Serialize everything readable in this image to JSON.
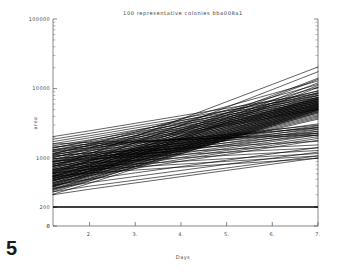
{
  "figure": {
    "number_label": "5",
    "background_color": "#ffffff",
    "line_color": "#000000",
    "text_color": "#444444"
  },
  "chart_data": {
    "type": "line",
    "title": "100 representative colonies  bba008a1",
    "xlabel": "Days",
    "ylabel": "area",
    "xlim": [
      1.2,
      7.0
    ],
    "ylim": [
      0,
      100000
    ],
    "yscale": "log",
    "xscale": "linear",
    "grid": false,
    "legend": false,
    "x_ticks": [
      "2.",
      "3.",
      "4.",
      "5.",
      "6.",
      "7."
    ],
    "x_tick_values": [
      2,
      3,
      4,
      5,
      6,
      7
    ],
    "y_ticks": [
      "100000",
      "10000",
      "1000",
      "200",
      "0"
    ],
    "y_tick_values": [
      100000,
      10000,
      1000,
      200,
      0
    ],
    "n_series": 100,
    "series_description": "100 colony area growth trajectories, log-scale, mostly rising from ~300-2000 at day 1.2 to ~1500-20000 at day 7, plus one flat baseline series at area 200",
    "baseline_series": {
      "name": "baseline",
      "value": 200,
      "x": [
        1.2,
        7.0
      ],
      "y": [
        200,
        200
      ]
    },
    "x": [
      1.2,
      2.0,
      3.0,
      4.0,
      5.0,
      6.0,
      7.0
    ],
    "series": [
      {
        "name": "c1",
        "values": [
          760,
          1150,
          2050,
          3650,
          6500,
          11500,
          20500
        ]
      },
      {
        "name": "c2",
        "values": [
          620,
          930,
          1680,
          3000,
          5400,
          9700,
          17500
        ]
      },
      {
        "name": "c3",
        "values": [
          540,
          800,
          1420,
          2520,
          4480,
          7950,
          14100
        ]
      },
      {
        "name": "c4",
        "values": [
          480,
          720,
          1300,
          2340,
          4200,
          7550,
          13600
        ]
      },
      {
        "name": "c5",
        "values": [
          440,
          660,
          1180,
          2110,
          3780,
          6760,
          12100
        ]
      },
      {
        "name": "c6",
        "values": [
          410,
          610,
          1090,
          1950,
          3480,
          6220,
          11100
        ]
      },
      {
        "name": "c7",
        "values": [
          390,
          580,
          1030,
          1840,
          3280,
          5850,
          10400
        ]
      },
      {
        "name": "c8",
        "values": [
          1150,
          1560,
          2380,
          3630,
          5540,
          8450,
          12900
        ]
      },
      {
        "name": "c9",
        "values": [
          1020,
          1390,
          2120,
          3240,
          4940,
          7540,
          11500
        ]
      },
      {
        "name": "c10",
        "values": [
          930,
          1270,
          1940,
          2960,
          4510,
          6880,
          10500
        ]
      },
      {
        "name": "c11",
        "values": [
          880,
          1180,
          1790,
          2700,
          4090,
          6190,
          9370
        ]
      },
      {
        "name": "c12",
        "values": [
          820,
          1100,
          1670,
          2530,
          3830,
          5800,
          8790
        ]
      },
      {
        "name": "c13",
        "values": [
          770,
          1040,
          1580,
          2400,
          3640,
          5530,
          8390
        ]
      },
      {
        "name": "c14",
        "values": [
          720,
          970,
          1480,
          2250,
          3420,
          5210,
          7930
        ]
      },
      {
        "name": "c15",
        "values": [
          680,
          920,
          1400,
          2130,
          3240,
          4930,
          7500
        ]
      },
      {
        "name": "c16",
        "values": [
          640,
          870,
          1330,
          2030,
          3100,
          4730,
          7220
        ]
      },
      {
        "name": "c17",
        "values": [
          600,
          820,
          1260,
          1930,
          2960,
          4540,
          6960
        ]
      },
      {
        "name": "c18",
        "values": [
          570,
          780,
          1200,
          1840,
          2830,
          4350,
          6680
        ]
      },
      {
        "name": "c19",
        "values": [
          540,
          740,
          1140,
          1760,
          2710,
          4180,
          6440
        ]
      },
      {
        "name": "c20",
        "values": [
          510,
          700,
          1080,
          1670,
          2580,
          3980,
          6150
        ]
      },
      {
        "name": "c21",
        "values": [
          490,
          670,
          1040,
          1610,
          2490,
          3860,
          5980
        ]
      },
      {
        "name": "c22",
        "values": [
          470,
          645,
          1000,
          1550,
          2400,
          3720,
          5770
        ]
      },
      {
        "name": "c23",
        "values": [
          450,
          620,
          960,
          1490,
          2310,
          3590,
          5570
        ]
      },
      {
        "name": "c24",
        "values": [
          430,
          595,
          925,
          1440,
          2240,
          3480,
          5420
        ]
      },
      {
        "name": "c25",
        "values": [
          415,
          575,
          895,
          1395,
          2170,
          3380,
          5270
        ]
      },
      {
        "name": "c26",
        "values": [
          400,
          555,
          865,
          1350,
          2100,
          3280,
          5120
        ]
      },
      {
        "name": "c27",
        "values": [
          385,
          535,
          835,
          1305,
          2040,
          3190,
          4990
        ]
      },
      {
        "name": "c28",
        "values": [
          370,
          515,
          805,
          1260,
          1970,
          3090,
          4840
        ]
      },
      {
        "name": "c29",
        "values": [
          355,
          495,
          775,
          1215,
          1900,
          2990,
          4690
        ]
      },
      {
        "name": "c30",
        "values": [
          345,
          480,
          750,
          1175,
          1840,
          2890,
          4540
        ]
      },
      {
        "name": "c31",
        "values": [
          1400,
          1790,
          2480,
          3440,
          4780,
          6630,
          9200
        ]
      },
      {
        "name": "c32",
        "values": [
          1280,
          1640,
          2280,
          3170,
          4410,
          6140,
          8540
        ]
      },
      {
        "name": "c33",
        "values": [
          1180,
          1520,
          2120,
          2950,
          4110,
          5730,
          7990
        ]
      },
      {
        "name": "c34",
        "values": [
          1100,
          1420,
          1980,
          2760,
          3850,
          5370,
          7490
        ]
      },
      {
        "name": "c35",
        "values": [
          1030,
          1330,
          1860,
          2600,
          3630,
          5070,
          7080
        ]
      },
      {
        "name": "c36",
        "values": [
          970,
          1255,
          1760,
          2460,
          3440,
          4810,
          6720
        ]
      },
      {
        "name": "c37",
        "values": [
          910,
          1180,
          1660,
          2320,
          3250,
          4550,
          6370
        ]
      },
      {
        "name": "c38",
        "values": [
          860,
          1115,
          1570,
          2200,
          3080,
          4320,
          6050
        ]
      },
      {
        "name": "c39",
        "values": [
          810,
          1055,
          1485,
          2085,
          2925,
          4105,
          5760
        ]
      },
      {
        "name": "c40",
        "values": [
          770,
          1000,
          1410,
          1980,
          2780,
          3900,
          5480
        ]
      },
      {
        "name": "c41",
        "values": [
          730,
          950,
          1340,
          1885,
          2650,
          3720,
          5230
        ]
      },
      {
        "name": "c42",
        "values": [
          695,
          905,
          1280,
          1800,
          2535,
          3565,
          5020
        ]
      },
      {
        "name": "c43",
        "values": [
          660,
          860,
          1215,
          1715,
          2420,
          3410,
          4810
        ]
      },
      {
        "name": "c44",
        "values": [
          630,
          820,
          1160,
          1640,
          2315,
          3265,
          4610
        ]
      },
      {
        "name": "c45",
        "values": [
          600,
          782,
          1108,
          1568,
          2215,
          3128,
          4420
        ]
      },
      {
        "name": "c46",
        "values": [
          575,
          750,
          1062,
          1504,
          2126,
          3005,
          4250
        ]
      },
      {
        "name": "c47",
        "values": [
          550,
          718,
          1018,
          1442,
          2040,
          2886,
          4085
        ]
      },
      {
        "name": "c48",
        "values": [
          528,
          690,
          978,
          1386,
          1963,
          2780,
          3938
        ]
      },
      {
        "name": "c49",
        "values": [
          506,
          661,
          938,
          1330,
          1885,
          2671,
          3786
        ]
      },
      {
        "name": "c50",
        "values": [
          486,
          635,
          902,
          1280,
          1815,
          2574,
          3650
        ]
      },
      {
        "name": "c51",
        "values": [
          2050,
          2480,
          3180,
          4080,
          5230,
          6700,
          8600
        ]
      },
      {
        "name": "c52",
        "values": [
          1880,
          2280,
          2930,
          3760,
          4830,
          6200,
          7960
        ]
      },
      {
        "name": "c53",
        "values": [
          1740,
          2110,
          2720,
          3500,
          4500,
          5790,
          7450
        ]
      },
      {
        "name": "c54",
        "values": [
          1620,
          1970,
          2540,
          3270,
          4210,
          5420,
          6980
        ]
      },
      {
        "name": "c55",
        "values": [
          1510,
          1840,
          2375,
          3065,
          3950,
          5095,
          6570
        ]
      },
      {
        "name": "c56",
        "values": [
          1420,
          1730,
          2235,
          2885,
          3725,
          4810,
          6210
        ]
      },
      {
        "name": "c57",
        "values": [
          1330,
          1622,
          2098,
          2712,
          3505,
          4532,
          5860
        ]
      },
      {
        "name": "c58",
        "values": [
          1255,
          1532,
          1983,
          2566,
          3320,
          4297,
          5562
        ]
      },
      {
        "name": "c59",
        "values": [
          1180,
          1442,
          1868,
          2420,
          3135,
          4062,
          5262
        ]
      },
      {
        "name": "c60",
        "values": [
          1115,
          1364,
          1768,
          2293,
          2973,
          3855,
          5000
        ]
      },
      {
        "name": "c61",
        "values": [
          305,
          438,
          712,
          1156,
          1878,
          3050,
          4955
        ]
      },
      {
        "name": "c62",
        "values": [
          330,
          470,
          760,
          1228,
          1985,
          3210,
          5190
        ]
      },
      {
        "name": "c63",
        "values": [
          360,
          510,
          818,
          1313,
          2106,
          3380,
          5425
        ]
      },
      {
        "name": "c64",
        "values": [
          395,
          556,
          885,
          1409,
          2243,
          3570,
          5682
        ]
      },
      {
        "name": "c65",
        "values": [
          430,
          602,
          952,
          1506,
          2382,
          3768,
          5960
        ]
      },
      {
        "name": "c66",
        "values": [
          470,
          654,
          1026,
          1610,
          2527,
          3966,
          6225
        ]
      },
      {
        "name": "c67",
        "values": [
          515,
          712,
          1108,
          1724,
          2683,
          4175,
          6496
        ]
      },
      {
        "name": "c68",
        "values": [
          560,
          769,
          1188,
          1836,
          2836,
          4381,
          6769
        ]
      },
      {
        "name": "c69",
        "values": [
          610,
          833,
          1277,
          1958,
          3002,
          4602,
          7055
        ]
      },
      {
        "name": "c70",
        "values": [
          665,
          903,
          1374,
          2090,
          3180,
          4838,
          7360
        ]
      },
      {
        "name": "c71",
        "values": [
          890,
          1095,
          1350,
          1665,
          2050,
          2530,
          3120
        ]
      },
      {
        "name": "c72",
        "values": [
          820,
          1012,
          1252,
          1548,
          1915,
          2368,
          2930
        ]
      },
      {
        "name": "c73",
        "values": [
          760,
          940,
          1166,
          1446,
          1794,
          2226,
          2762
        ]
      },
      {
        "name": "c74",
        "values": [
          700,
          870,
          1082,
          1346,
          1675,
          2084,
          2592
        ]
      },
      {
        "name": "c75",
        "values": [
          650,
          810,
          1010,
          1260,
          1572,
          1961,
          2446
        ]
      },
      {
        "name": "c76",
        "values": [
          600,
          750,
          938,
          1174,
          1469,
          1838,
          2300
        ]
      },
      {
        "name": "c77",
        "values": [
          560,
          702,
          880,
          1104,
          1385,
          1737,
          2179
        ]
      },
      {
        "name": "c78",
        "values": [
          520,
          653,
          820,
          1031,
          1296,
          1629,
          2048
        ]
      },
      {
        "name": "c79",
        "values": [
          485,
          610,
          768,
          967,
          1218,
          1534,
          1932
        ]
      },
      {
        "name": "c80",
        "values": [
          450,
          568,
          717,
          904,
          1141,
          1440,
          1817
        ]
      },
      {
        "name": "c81",
        "values": [
          1250,
          1410,
          1640,
          1905,
          2215,
          2575,
          2995
        ]
      },
      {
        "name": "c82",
        "values": [
          1150,
          1302,
          1518,
          1770,
          2064,
          2406,
          2805
        ]
      },
      {
        "name": "c83",
        "values": [
          1060,
          1203,
          1406,
          1643,
          1920,
          2244,
          2622
        ]
      },
      {
        "name": "c84",
        "values": [
          980,
          1114,
          1305,
          1528,
          1790,
          2096,
          2455
        ]
      },
      {
        "name": "c85",
        "values": [
          905,
          1031,
          1210,
          1420,
          1666,
          1955,
          2294
        ]
      },
      {
        "name": "c86",
        "values": [
          840,
          958,
          1126,
          1324,
          1556,
          1829,
          2150
        ]
      },
      {
        "name": "c87",
        "values": [
          1330,
          1500,
          1690,
          1905,
          2148,
          2421,
          2730
        ]
      },
      {
        "name": "c88",
        "values": [
          1450,
          1600,
          1720,
          1850,
          1990,
          2140,
          2300
        ]
      },
      {
        "name": "c89",
        "values": [
          1600,
          1700,
          1780,
          1865,
          1955,
          2048,
          2145
        ]
      },
      {
        "name": "c90",
        "values": [
          1080,
          1195,
          1290,
          1393,
          1504,
          1624,
          1754
        ]
      },
      {
        "name": "c91",
        "values": [
          980,
          1078,
          1160,
          1249,
          1344,
          1447,
          1558
        ]
      },
      {
        "name": "c92",
        "values": [
          900,
          985,
          1058,
          1137,
          1222,
          1313,
          1411
        ]
      },
      {
        "name": "c93",
        "values": [
          780,
          862,
          935,
          1014,
          1100,
          1193,
          1294
        ]
      },
      {
        "name": "c94",
        "values": [
          690,
          764,
          832,
          906,
          987,
          1075,
          1171
        ]
      },
      {
        "name": "c95",
        "values": [
          620,
          690,
          755,
          826,
          904,
          989,
          1082
        ]
      },
      {
        "name": "c96",
        "values": [
          550,
          615,
          678,
          747,
          823,
          907,
          1000
        ]
      },
      {
        "name": "c97",
        "values": [
          330,
          398,
          486,
          594,
          726,
          887,
          1084
        ]
      },
      {
        "name": "c98",
        "values": [
          300,
          360,
          443,
          545,
          670,
          824,
          1013
        ]
      },
      {
        "name": "c99",
        "values": [
          370,
          448,
          548,
          670,
          820,
          1003,
          1227
        ]
      },
      {
        "name": "c100",
        "values": [
          410,
          500,
          617,
          761,
          939,
          1158,
          1428
        ]
      }
    ]
  }
}
